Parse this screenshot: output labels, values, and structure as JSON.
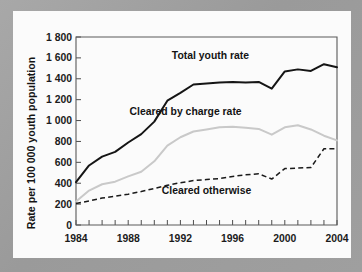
{
  "chart_data": {
    "type": "line",
    "title": "",
    "xlabel": "",
    "ylabel": "Rate per 100 000 youth population",
    "xlim": [
      1984,
      2004
    ],
    "ylim": [
      0,
      1800
    ],
    "grid": false,
    "legend_position": "inline-annotations",
    "x": [
      1984,
      1985,
      1986,
      1987,
      1988,
      1989,
      1990,
      1991,
      1992,
      1993,
      1994,
      1995,
      1996,
      1997,
      1998,
      1999,
      2000,
      2001,
      2002,
      2003,
      2004
    ],
    "xticks": [
      "1984",
      "1988",
      "1992",
      "1996",
      "2000",
      "2004"
    ],
    "xtick_values": [
      1984,
      1988,
      1992,
      1996,
      2000,
      2004
    ],
    "yticks": [
      "0",
      "200",
      "400",
      "600",
      "800",
      "1 000",
      "1 200",
      "1 400",
      "1 600",
      "1 800"
    ],
    "ytick_values": [
      0,
      200,
      400,
      600,
      800,
      1000,
      1200,
      1400,
      1600,
      1800
    ],
    "series": [
      {
        "name": "Total youth rate",
        "style": "solid-black",
        "color": "#151515",
        "label_x": 1994.3,
        "label_y": 1590,
        "values": [
          410,
          570,
          655,
          700,
          790,
          870,
          990,
          1190,
          1265,
          1345,
          1355,
          1365,
          1370,
          1365,
          1370,
          1305,
          1470,
          1490,
          1475,
          1540,
          1510
        ]
      },
      {
        "name": "Cleared by charge rate",
        "style": "solid-grey",
        "color": "#c9c9c9",
        "label_x": 1992.4,
        "label_y": 1055,
        "values": [
          225,
          330,
          390,
          415,
          465,
          510,
          610,
          760,
          840,
          895,
          915,
          935,
          940,
          930,
          920,
          865,
          935,
          955,
          915,
          855,
          810
        ]
      },
      {
        "name": "Cleared otherwise",
        "style": "dashed-black",
        "color": "#1a1a1a",
        "label_x": 1994.0,
        "label_y": 300,
        "values": [
          205,
          230,
          258,
          275,
          295,
          320,
          350,
          380,
          405,
          425,
          435,
          445,
          465,
          480,
          490,
          440,
          540,
          545,
          550,
          730,
          730
        ]
      }
    ]
  }
}
